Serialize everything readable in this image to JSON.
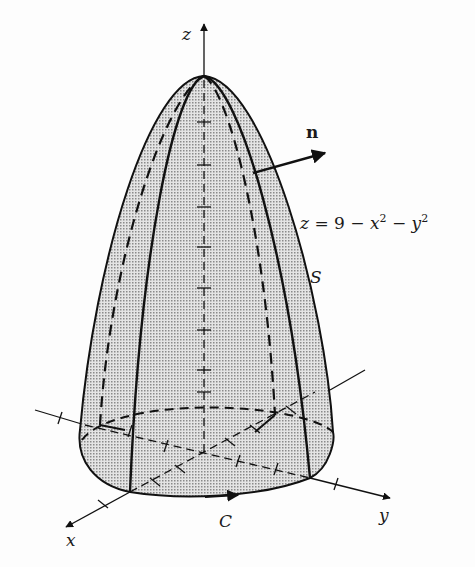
{
  "figure": {
    "type": "3d-surface-diagram",
    "surface_label": "S",
    "equation": {
      "lhs": "z",
      "eq": "=",
      "const": "9",
      "minus1": "−",
      "x": "x",
      "x_exp": "2",
      "minus2": "−",
      "y": "y",
      "y_exp": "2"
    },
    "normal_label": "n",
    "boundary_curve_label": "C",
    "axes": {
      "x": "x",
      "y": "y",
      "z": "z"
    }
  },
  "colors": {
    "ink": "#111111",
    "fill": "#c9c9c9",
    "background": "#fdfdfd"
  }
}
